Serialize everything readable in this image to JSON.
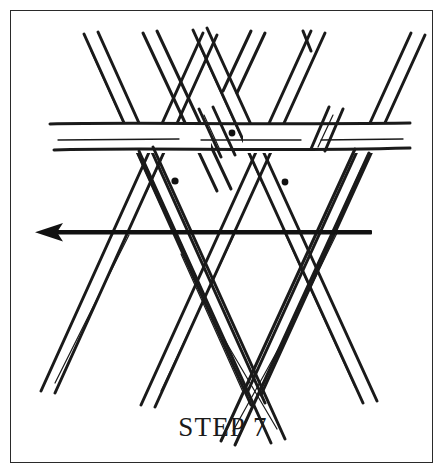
{
  "figure": {
    "caption": "STEP 7",
    "background_color": "#ffffff",
    "ink_color": "#1a1a1a",
    "frame": {
      "stroke_color": "#2a2a2a",
      "stroke_width": 1.4,
      "x": 10,
      "y": 10,
      "width": 423,
      "height": 453
    },
    "arrow": {
      "name": "direction-arrow",
      "points": "left",
      "color": "#111111",
      "tip_x": 35,
      "tail_x": 372,
      "y": 232,
      "shaft_width": 4,
      "head_length": 26,
      "head_half_height": 9
    },
    "markers": [
      {
        "name": "weave-point-top",
        "cx": 232,
        "cy": 133,
        "r": 3.4
      },
      {
        "name": "weave-point-left",
        "cx": 175,
        "cy": 181,
        "r": 3.6
      },
      {
        "name": "weave-point-right",
        "cx": 285,
        "cy": 182,
        "r": 3.4
      }
    ],
    "horizontal_strips": [
      {
        "name": "horizontal-strip-upper-edge",
        "x1": 50,
        "y1": 124,
        "x2": 410,
        "y2": 123
      },
      {
        "name": "horizontal-strip-lower-edge",
        "x1": 54,
        "y1": 150,
        "x2": 410,
        "y2": 148
      },
      {
        "name": "horizontal-strip-center-crease",
        "x1": 58,
        "y1": 141,
        "x2": 406,
        "y2": 140
      }
    ],
    "strip_width": 14,
    "counts": {
      "horizontal_strips": 1,
      "down_right_strips": 4,
      "down_left_strips": 4,
      "marker_dots": 3
    }
  }
}
